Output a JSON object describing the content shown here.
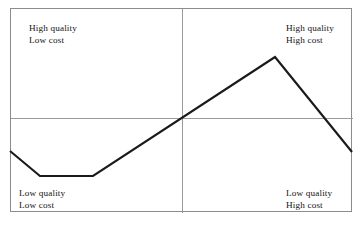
{
  "figure": {
    "border_color": "#8c8c8c",
    "axis_color": "#9a9a9a",
    "line_color": "#1a1a1a",
    "background": "#ffffff"
  },
  "quadrants": {
    "top_left": {
      "line1": "High quality",
      "line2": "Low cost"
    },
    "top_right": {
      "line1": "High quality",
      "line2": "High cost"
    },
    "bottom_left": {
      "line1": "Low quality",
      "line2": "Low cost"
    },
    "bottom_right": {
      "line1": "Low quality",
      "line2": "High cost"
    }
  },
  "chart_data": {
    "type": "line",
    "title": "",
    "xlabel": "",
    "ylabel": "",
    "grid": false,
    "legend": "none",
    "axes": {
      "origin_x": 181,
      "origin_y": 118,
      "x_axis_drawn": true,
      "y_axis_drawn": true,
      "xlim": [
        10,
        352
      ],
      "ylim": [
        212,
        8
      ]
    },
    "quadrant_labels": [
      "High quality / Low cost",
      "High quality / High cost",
      "Low quality / Low cost",
      "Low quality / High cost"
    ],
    "series": [
      {
        "name": "cost-quality relationship",
        "points": [
          {
            "x": 10,
            "y": 151
          },
          {
            "x": 40,
            "y": 176
          },
          {
            "x": 93,
            "y": 176
          },
          {
            "x": 275,
            "y": 57
          },
          {
            "x": 352,
            "y": 152
          }
        ]
      }
    ],
    "annotations": [
      {
        "label": "trough-start",
        "x": 40,
        "y": 176
      },
      {
        "label": "trough-end",
        "x": 93,
        "y": 176
      },
      {
        "label": "peak",
        "x": 275,
        "y": 57
      },
      {
        "label": "axis-crossing",
        "x": 181,
        "y": 118
      }
    ]
  },
  "caption_fragment": ""
}
